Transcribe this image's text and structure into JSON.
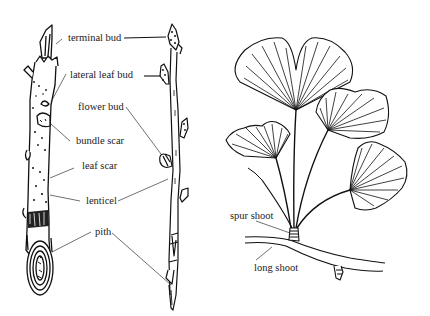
{
  "diagram": {
    "panels": [
      {
        "id": "twig-pair",
        "description": "two winter twigs with labeled features"
      },
      {
        "id": "ginkgo",
        "description": "ginkgo leaves on spur shoot attached to long shoot"
      }
    ]
  },
  "labels": {
    "terminal_bud": "terminal bud",
    "lateral_leaf_bud": "lateral leaf bud",
    "flower_bud": "flower bud",
    "bundle_scar": "bundle scar",
    "leaf_scar": "leaf scar",
    "lenticel": "lenticel",
    "pith": "pith",
    "spur_shoot": "spur shoot",
    "long_shoot": "long shoot"
  },
  "colors": {
    "ink": "#111111",
    "leader": "#555555",
    "background": "#ffffff"
  }
}
